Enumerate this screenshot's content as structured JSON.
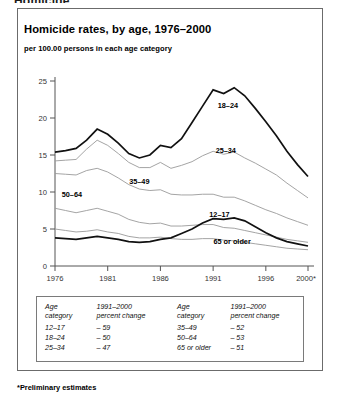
{
  "cutoff_heading": "Homicide",
  "figure": {
    "title": "Homicide rates, by age, 1976–2000",
    "subtitle": "per 100.00 persons in each age category",
    "footnote": "*Preliminary estimates"
  },
  "table": {
    "headers": {
      "age_line1": "Age",
      "age_line2": "category",
      "change_line1": "1991–2000",
      "change_line2": "percent change"
    },
    "left_rows": [
      {
        "category": "12–17",
        "change": "– 59"
      },
      {
        "category": "18–24",
        "change": "– 50"
      },
      {
        "category": "25–34",
        "change": "– 47"
      }
    ],
    "right_rows": [
      {
        "category": "35–49",
        "change": "– 52"
      },
      {
        "category": "50–64",
        "change": "– 53"
      },
      {
        "category": "65 or older",
        "change": "– 51"
      }
    ]
  },
  "chart_data": {
    "type": "line",
    "title": "Homicide rates, by age, 1976–2000",
    "subtitle": "per 100.00 persons in each age category",
    "xlabel": "",
    "ylabel": "per 100.00 persons in each age category",
    "x": [
      1976,
      1977,
      1978,
      1979,
      1980,
      1981,
      1982,
      1983,
      1984,
      1985,
      1986,
      1987,
      1988,
      1989,
      1990,
      1991,
      1992,
      1993,
      1994,
      1995,
      1996,
      1997,
      1998,
      1999,
      2000
    ],
    "xlim": [
      1976,
      2000
    ],
    "ylim": [
      0,
      25
    ],
    "xticks": [
      1976,
      1981,
      1986,
      1991,
      1996,
      2000
    ],
    "xticklabels": [
      "1976",
      "1981",
      "1986",
      "1991",
      "1996",
      "2000*"
    ],
    "yticks": [
      0,
      5,
      10,
      15,
      20,
      25
    ],
    "grid": false,
    "legend_position": "inline-labels",
    "series": [
      {
        "name": "18–24",
        "emphasis": "bold",
        "label_x": 1992.4,
        "label_y": 21.3,
        "values": [
          15.4,
          15.6,
          15.9,
          17.0,
          18.5,
          17.8,
          16.6,
          15.2,
          14.6,
          15.0,
          16.3,
          16.0,
          17.2,
          19.4,
          21.6,
          23.8,
          23.3,
          24.1,
          23.0,
          21.3,
          19.5,
          17.6,
          15.5,
          13.7,
          12.1
        ]
      },
      {
        "name": "25–34",
        "emphasis": "normal",
        "label_x": 1992.2,
        "label_y": 15.3,
        "values": [
          14.2,
          14.3,
          14.4,
          15.8,
          17.0,
          16.3,
          15.2,
          14.0,
          13.3,
          13.3,
          14.0,
          13.2,
          13.6,
          14.1,
          14.9,
          15.5,
          15.1,
          15.4,
          14.6,
          13.9,
          13.1,
          12.3,
          11.2,
          10.2,
          9.2
        ]
      },
      {
        "name": "35–49",
        "emphasis": "normal",
        "label_x": 1984.0,
        "label_y": 11.1,
        "values": [
          12.5,
          12.4,
          12.3,
          12.9,
          13.2,
          12.7,
          11.9,
          11.0,
          10.4,
          10.2,
          10.3,
          9.7,
          9.6,
          9.6,
          9.7,
          9.7,
          9.3,
          9.3,
          8.8,
          8.2,
          7.6,
          7.1,
          6.5,
          6.0,
          5.5
        ]
      },
      {
        "name": "50–64",
        "emphasis": "normal",
        "label_x": 1977.6,
        "label_y": 9.3,
        "values": [
          7.8,
          7.5,
          7.2,
          7.5,
          7.8,
          7.4,
          7.0,
          6.3,
          5.9,
          5.7,
          5.8,
          5.4,
          5.4,
          5.5,
          5.6,
          5.6,
          5.2,
          5.1,
          4.8,
          4.5,
          4.2,
          3.9,
          3.6,
          3.4,
          3.2
        ]
      },
      {
        "name": "65 or older",
        "emphasis": "normal",
        "label_x": 1992.8,
        "label_y": 3.0,
        "values": [
          5.0,
          4.8,
          4.6,
          4.7,
          4.9,
          4.6,
          4.4,
          4.0,
          3.8,
          3.8,
          3.9,
          3.7,
          3.6,
          3.6,
          3.7,
          3.7,
          3.5,
          3.4,
          3.2,
          3.0,
          2.8,
          2.6,
          2.4,
          2.3,
          2.2
        ]
      },
      {
        "name": "12–17",
        "emphasis": "bold",
        "label_x": 1991.6,
        "label_y": 6.6,
        "values": [
          3.8,
          3.7,
          3.6,
          3.8,
          4.0,
          3.8,
          3.6,
          3.3,
          3.2,
          3.3,
          3.6,
          3.8,
          4.4,
          5.0,
          5.8,
          6.4,
          6.3,
          6.5,
          6.1,
          5.3,
          4.5,
          3.8,
          3.3,
          3.0,
          2.7
        ]
      }
    ]
  }
}
